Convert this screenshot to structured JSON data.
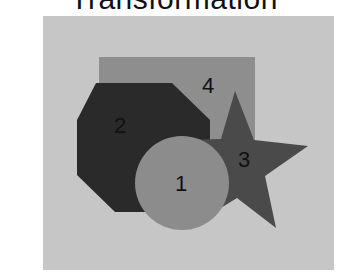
{
  "title": "Transformation",
  "colors": {
    "background": "#c6c6c6",
    "rectangle": "#8e8e8e",
    "octagon": "#2a2a2a",
    "star": "#4a4a4a",
    "circle": "#8c8c8c",
    "label": "#111111"
  },
  "shapes": [
    {
      "id": 1,
      "type": "circle",
      "label": "1"
    },
    {
      "id": 2,
      "type": "octagon",
      "label": "2"
    },
    {
      "id": 3,
      "type": "star",
      "label": "3"
    },
    {
      "id": 4,
      "type": "rectangle",
      "label": "4"
    }
  ]
}
